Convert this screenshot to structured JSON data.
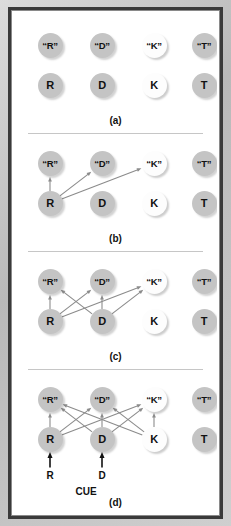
{
  "figure": {
    "node_columns": [
      36,
      88,
      140,
      190
    ],
    "rows": {
      "output": 8,
      "input": 48
    },
    "node_types": {
      "gray": "#c4c4c4",
      "white": "#fdfdfd",
      "arrow_gray": "#8b8b8b",
      "arrow_black": "#111111"
    },
    "panels": [
      {
        "id": "a",
        "label": "(a)",
        "top": 12,
        "height": 112,
        "output_nodes": [
          {
            "text": "“R”",
            "col": 0,
            "fill": "gray"
          },
          {
            "text": "“D”",
            "col": 1,
            "fill": "gray"
          },
          {
            "text": "“K”",
            "col": 2,
            "fill": "white"
          },
          {
            "text": "“T”",
            "col": 3,
            "fill": "gray"
          }
        ],
        "input_nodes": [
          {
            "text": "R",
            "col": 0,
            "fill": "gray"
          },
          {
            "text": "D",
            "col": 1,
            "fill": "gray"
          },
          {
            "text": "K",
            "col": 2,
            "fill": "white"
          },
          {
            "text": "T",
            "col": 3,
            "fill": "gray"
          }
        ],
        "arrows": [],
        "cue_arrows": [],
        "cue_letters": [],
        "cue_word": null
      },
      {
        "id": "b",
        "label": "(b)",
        "top": 130,
        "height": 112,
        "output_nodes": [
          {
            "text": "“R”",
            "col": 0,
            "fill": "gray"
          },
          {
            "text": "“D”",
            "col": 1,
            "fill": "gray"
          },
          {
            "text": "“K”",
            "col": 2,
            "fill": "white"
          },
          {
            "text": "“T”",
            "col": 3,
            "fill": "gray"
          }
        ],
        "input_nodes": [
          {
            "text": "R",
            "col": 0,
            "fill": "gray"
          },
          {
            "text": "D",
            "col": 1,
            "fill": "gray"
          },
          {
            "text": "K",
            "col": 2,
            "fill": "white"
          },
          {
            "text": "T",
            "col": 3,
            "fill": "gray"
          }
        ],
        "arrows": [
          {
            "from": 0,
            "to": 0
          },
          {
            "from": 0,
            "to": 1
          },
          {
            "from": 0,
            "to": 2
          }
        ],
        "cue_arrows": [],
        "cue_letters": [],
        "cue_word": null
      },
      {
        "id": "c",
        "label": "(c)",
        "top": 248,
        "height": 112,
        "output_nodes": [
          {
            "text": "“R”",
            "col": 0,
            "fill": "gray"
          },
          {
            "text": "“D”",
            "col": 1,
            "fill": "gray"
          },
          {
            "text": "“K”",
            "col": 2,
            "fill": "white"
          },
          {
            "text": "“T”",
            "col": 3,
            "fill": "gray"
          }
        ],
        "input_nodes": [
          {
            "text": "R",
            "col": 0,
            "fill": "gray"
          },
          {
            "text": "D",
            "col": 1,
            "fill": "gray"
          },
          {
            "text": "K",
            "col": 2,
            "fill": "white"
          },
          {
            "text": "T",
            "col": 3,
            "fill": "gray"
          }
        ],
        "arrows": [
          {
            "from": 0,
            "to": 0
          },
          {
            "from": 0,
            "to": 1
          },
          {
            "from": 0,
            "to": 2
          },
          {
            "from": 1,
            "to": 0
          },
          {
            "from": 1,
            "to": 1
          },
          {
            "from": 1,
            "to": 2
          }
        ],
        "cue_arrows": [],
        "cue_letters": [],
        "cue_word": null
      },
      {
        "id": "d",
        "label": "(d)",
        "top": 366,
        "height": 140,
        "output_nodes": [
          {
            "text": "“R”",
            "col": 0,
            "fill": "gray"
          },
          {
            "text": "“D”",
            "col": 1,
            "fill": "gray"
          },
          {
            "text": "“K”",
            "col": 2,
            "fill": "white"
          },
          {
            "text": "“T”",
            "col": 3,
            "fill": "gray"
          }
        ],
        "input_nodes": [
          {
            "text": "R",
            "col": 0,
            "fill": "gray"
          },
          {
            "text": "D",
            "col": 1,
            "fill": "gray"
          },
          {
            "text": "K",
            "col": 2,
            "fill": "white"
          },
          {
            "text": "T",
            "col": 3,
            "fill": "gray"
          }
        ],
        "arrows": [
          {
            "from": 0,
            "to": 0
          },
          {
            "from": 0,
            "to": 1
          },
          {
            "from": 0,
            "to": 2
          },
          {
            "from": 1,
            "to": 0
          },
          {
            "from": 1,
            "to": 1
          },
          {
            "from": 1,
            "to": 2
          },
          {
            "from": 2,
            "to": 0
          },
          {
            "from": 2,
            "to": 1
          },
          {
            "from": 2,
            "to": 2
          }
        ],
        "cue_arrows": [
          0,
          1
        ],
        "cue_letters": [
          {
            "text": "R",
            "col": 0
          },
          {
            "text": "D",
            "col": 1
          }
        ],
        "cue_word": "CUE"
      }
    ]
  }
}
